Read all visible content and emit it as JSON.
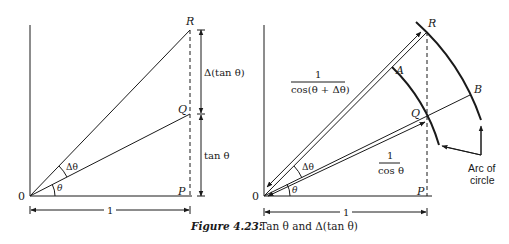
{
  "figure": {
    "caption_label": "Figure 4.23:",
    "caption_text": "Tan θ and Δ(tan θ)"
  },
  "left_diagram": {
    "origin_label": "0",
    "points": {
      "R": "R",
      "Q": "Q",
      "P": "P"
    },
    "angle_theta": "θ",
    "angle_delta_theta": "Δθ",
    "dim_upper": "Δ(tan θ)",
    "dim_lower": "tan θ",
    "dim_base": "1"
  },
  "right_diagram": {
    "origin_label": "0",
    "points": {
      "R": "R",
      "Q": "Q",
      "P": "P",
      "A": "A",
      "B": "B"
    },
    "angle_theta": "θ",
    "angle_delta_theta": "Δθ",
    "label_long_num": "1",
    "label_long_den": "cos(θ + Δθ)",
    "label_short_num": "1",
    "label_short_den": "cos θ",
    "dim_base": "1",
    "arc_label_line1": "Arc of",
    "arc_label_line2": "circle"
  },
  "colors": {
    "ink": "#1a1a1a",
    "background": "#ffffff"
  }
}
